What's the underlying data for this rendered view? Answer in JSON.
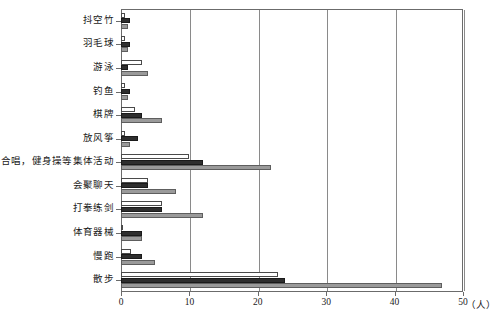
{
  "chart_data": {
    "type": "bar",
    "orientation": "horizontal",
    "title": "",
    "xlabel": "(人)",
    "ylabel": "",
    "xlim": [
      0,
      50
    ],
    "xticks": [
      0,
      10,
      20,
      30,
      40,
      50
    ],
    "xtick_labels": [
      "0",
      "10",
      "20",
      "30",
      "40",
      "50"
    ],
    "grid": true,
    "grid_axis": "x",
    "legend": false,
    "categories": [
      "抖空竹",
      "羽毛球",
      "游泳",
      "钓鱼",
      "棋牌",
      "放风筝",
      "合唱，健身操等集体活动",
      "会聚聊天",
      "打拳练剑",
      "体育器械",
      "慢跑",
      "散步"
    ],
    "series": [
      {
        "name": "series-1",
        "color": "#ffffff",
        "values": [
          0.6,
          0.6,
          3.0,
          0.6,
          2.0,
          0.6,
          10.0,
          4.0,
          6.0,
          0.3,
          1.5,
          23.0
        ]
      },
      {
        "name": "series-2",
        "color": "#2e2e2e",
        "values": [
          1.3,
          1.3,
          1.0,
          1.3,
          3.0,
          2.5,
          12.0,
          4.0,
          6.0,
          3.0,
          3.0,
          24.0
        ]
      },
      {
        "name": "series-3",
        "color": "#9a9a9a",
        "values": [
          1.0,
          1.0,
          4.0,
          1.0,
          6.0,
          1.3,
          22.0,
          8.0,
          12.0,
          3.0,
          5.0,
          47.0
        ]
      }
    ]
  },
  "axis": {
    "unit_label": "（人）"
  }
}
